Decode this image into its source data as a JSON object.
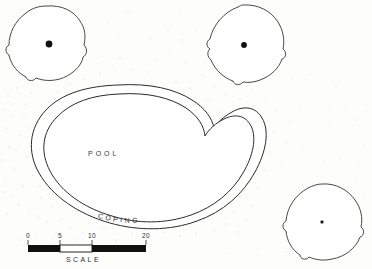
{
  "drawing": {
    "type": "site-plan",
    "title_visible": false,
    "background_color": "#fdfdfc",
    "ink_color": "#2a2a2a",
    "labels": {
      "pool": "POOL",
      "coping": "COPING",
      "scale_caption": "SCALE"
    },
    "pool": {
      "name": "kidney-shaped-pool",
      "has_coping_band": true,
      "water_fill": "#ffffff",
      "outline_color": "#2a2a2a"
    },
    "trees": [
      {
        "name": "tree-top-left",
        "cx": 49,
        "cy": 44,
        "marker": "dot",
        "marker_size": 5
      },
      {
        "name": "tree-top-right",
        "cx": 244,
        "cy": 45,
        "marker": "dot",
        "marker_size": 4.2
      },
      {
        "name": "tree-bottom-right",
        "cx": 322,
        "cy": 222,
        "marker": "dot",
        "marker_size": 2.4
      }
    ],
    "scale_bar": {
      "ticks": [
        "0",
        "5",
        "10",
        "20"
      ],
      "tick_positions": [
        28,
        60,
        92,
        146
      ],
      "bar_left": 28,
      "bar_right": 146,
      "bar_top": 245,
      "bar_height": 7,
      "segments": [
        {
          "from": 28,
          "to": 60,
          "fill": "#111111"
        },
        {
          "from": 60,
          "to": 92,
          "fill": "#ffffff"
        },
        {
          "from": 92,
          "to": 146,
          "fill": "#111111"
        }
      ]
    },
    "coping_text_path": "COPING",
    "stipple": {
      "present": true,
      "color": "#b9b9b9",
      "description": "scattered ground texture dots"
    }
  }
}
